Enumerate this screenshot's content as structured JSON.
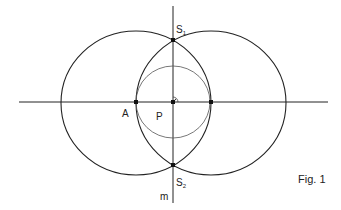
{
  "figure": {
    "caption": "Fig. 1",
    "line_color": "#222222",
    "thin_line_color": "#555555",
    "point_color": "#111111"
  },
  "labels": {
    "S1_main": "S",
    "S1_sub": "1",
    "S2_main": "S",
    "S2_sub": "2",
    "A": "A",
    "P": "P",
    "m": "m"
  },
  "geometry": {
    "horizontal_line": {
      "x1": 19,
      "y1": 102,
      "x2": 328,
      "y2": 102
    },
    "vertical_line_m": {
      "x1": 173,
      "y1": 6,
      "x2": 173,
      "y2": 203
    },
    "left_circle": {
      "cx": 136,
      "cy": 103,
      "rx": 75,
      "ry": 72
    },
    "right_circle": {
      "cx": 211,
      "cy": 103,
      "rx": 75,
      "ry": 72
    },
    "inner_circle": {
      "cx": 173,
      "cy": 102,
      "rx": 37,
      "ry": 36
    },
    "points": [
      {
        "name": "A",
        "x": 136,
        "y": 102
      },
      {
        "name": "P",
        "x": 173,
        "y": 102
      },
      {
        "name": "B",
        "x": 211,
        "y": 102
      },
      {
        "name": "S1",
        "x": 173,
        "y": 40
      },
      {
        "name": "S2",
        "x": 173,
        "y": 165
      }
    ],
    "right_angle_marker": {
      "x": 173,
      "y": 102,
      "r": 5
    }
  }
}
